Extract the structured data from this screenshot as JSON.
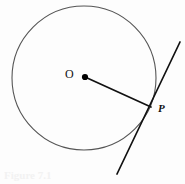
{
  "figure": {
    "type": "geometry-diagram",
    "background_color": "#fdfdfd",
    "caption_ghost_text": "Figure 7.1",
    "labels": {
      "center": "O",
      "tangent_point": "P"
    },
    "colors": {
      "circle_stroke": "#555555",
      "radius_stroke": "#111111",
      "tangent_stroke": "#111111",
      "center_dot": "#000000",
      "label_text": "#111111",
      "caption_ghost": "#f2f2f2"
    },
    "geometry": {
      "circle": {
        "cx": 84,
        "cy": 78,
        "r": 72,
        "stroke_width": 1.1
      },
      "center_point": {
        "x": 85,
        "y": 77,
        "dot_radius": 3.1
      },
      "tangent_point": {
        "x": 151,
        "y": 107
      },
      "radius_segment": {
        "x1": 85,
        "y1": 77,
        "x2": 151,
        "y2": 107,
        "stroke_width": 1.7
      },
      "tangent_segment": {
        "x1": 180,
        "y1": 42,
        "x2": 117,
        "y2": 174,
        "stroke_width": 1.7
      }
    }
  }
}
